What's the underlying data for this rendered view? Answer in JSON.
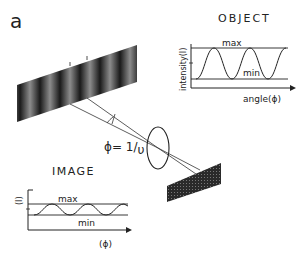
{
  "panel_label": "a",
  "object": {
    "title": "OBJECT",
    "y_axis_label": "intensity(I)",
    "x_axis_label": "angle(ϕ)",
    "max_label": "max",
    "min_label": "min"
  },
  "image": {
    "title": "IMAGE",
    "y_axis_label": "(I)",
    "x_axis_label": "(ϕ)",
    "max_label": "max",
    "min_label": "min"
  },
  "angle_formula": {
    "symbol": "ϕ",
    "eq": "= 1/",
    "var": "υ"
  },
  "colors": {
    "ink": "#222222",
    "grating_dark": "#1a1a1a",
    "grating_light": "#8a8a8a",
    "background": "#ffffff"
  }
}
